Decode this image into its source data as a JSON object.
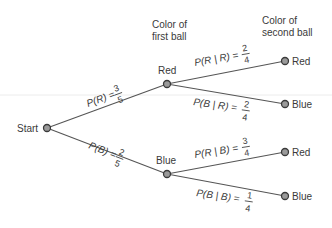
{
  "headers": {
    "first_ball": [
      "Color of",
      "first ball"
    ],
    "second_ball": [
      "Color of",
      "second ball"
    ]
  },
  "nodes": {
    "start": "Start",
    "first_red": "Red",
    "first_blue": "Blue",
    "rr": "Red",
    "rb": "Blue",
    "br": "Red",
    "bb": "Blue"
  },
  "probabilities": {
    "p_red": {
      "label": "P(R) =",
      "num": "3",
      "den": "5"
    },
    "p_blue": {
      "label": "P(B) =",
      "num": "2",
      "den": "5"
    },
    "p_red_given_red": {
      "label": "P(R | R) =",
      "num": "2",
      "den": "4"
    },
    "p_blue_given_red": {
      "label": "P(B | R) =",
      "num": "2",
      "den": "4"
    },
    "p_red_given_blue": {
      "label": "P(R | B) =",
      "num": "3",
      "den": "4"
    },
    "p_blue_given_blue": {
      "label": "P(B | B) =",
      "num": "1",
      "den": "4"
    }
  },
  "colors": {
    "node_fill": "#9a9a9a",
    "node_stroke": "#3a3a3a",
    "edge": "#555555",
    "text": "#3a3a3a"
  }
}
